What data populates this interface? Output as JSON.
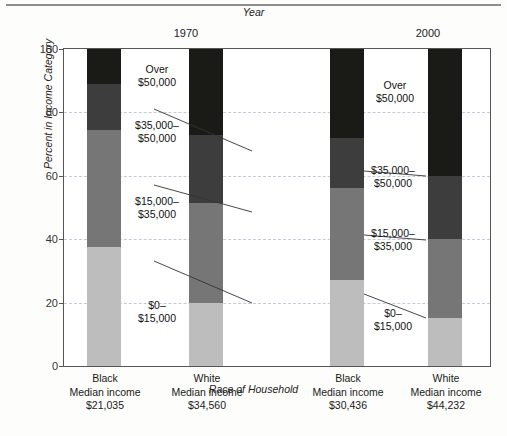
{
  "figure": {
    "top_axis_title": "Year",
    "y_axis_title": "Percent in Income Category",
    "x_axis_title": "Race of Household"
  },
  "axis": {
    "y_ticks": [
      "100",
      "80",
      "60",
      "40",
      "20",
      "0"
    ],
    "y_tick_values": [
      100,
      80,
      60,
      40,
      20,
      0
    ],
    "y_min": 0,
    "y_max": 100
  },
  "groups": [
    {
      "label": "1970"
    },
    {
      "label": "2000"
    }
  ],
  "categories": [
    {
      "race": "Black",
      "income_line": "Median income",
      "median_income": "$21,035",
      "year": "1970"
    },
    {
      "race": "White",
      "income_line": "Median income",
      "median_income": "$34,560",
      "year": "1970"
    },
    {
      "race": "Black",
      "income_line": "Median income",
      "median_income": "$30,436",
      "year": "2000"
    },
    {
      "race": "White",
      "income_line": "Median income",
      "median_income": "$44,232",
      "year": "2000"
    }
  ],
  "annotations": {
    "over_50k": "Over\n$50,000",
    "r35_50k": "$35,000–\n$50,000",
    "r15_35k": "$15,000–\n$35,000",
    "r0_15k": "$0–\n$15,000"
  },
  "colors": {
    "over_50k": "#1a1a16",
    "r35_50k": "#3d3d3d",
    "r15_35k": "#767676",
    "r0_15k": "#bdbdbd",
    "grid": "#b9c2d0",
    "frame": "#555555"
  },
  "chart_data": {
    "type": "bar",
    "title": "",
    "subtitle": "",
    "xlabel": "Race of Household",
    "ylabel": "Percent in Income Category",
    "toplabel": "Year",
    "ylim": [
      0,
      100
    ],
    "grid": true,
    "legend": "inline-annotations",
    "stacked": true,
    "categories": [
      "1970 Black (Median income $21,035)",
      "1970 White (Median income $34,560)",
      "2000 Black (Median income $30,436)",
      "2000 White (Median income $44,232)"
    ],
    "series": [
      {
        "name": "$0–$15,000",
        "color": "#bdbdbd",
        "values": [
          37.5,
          20.0,
          27.0,
          15.0
        ]
      },
      {
        "name": "$15,000–$35,000",
        "color": "#767676",
        "values": [
          37.0,
          31.5,
          29.0,
          25.0
        ]
      },
      {
        "name": "$35,000–$50,000",
        "color": "#3d3d3d",
        "values": [
          14.5,
          21.5,
          16.0,
          20.0
        ]
      },
      {
        "name": "Over $50,000",
        "color": "#1a1a16",
        "values": [
          11.0,
          27.0,
          28.0,
          40.0
        ]
      }
    ],
    "cumulative_tops": [
      [
        37.5,
        74.5,
        89.0,
        100.0
      ],
      [
        20.0,
        51.5,
        73.0,
        100.0
      ],
      [
        27.0,
        56.0,
        72.0,
        100.0
      ],
      [
        15.0,
        40.0,
        60.0,
        100.0
      ]
    ]
  }
}
